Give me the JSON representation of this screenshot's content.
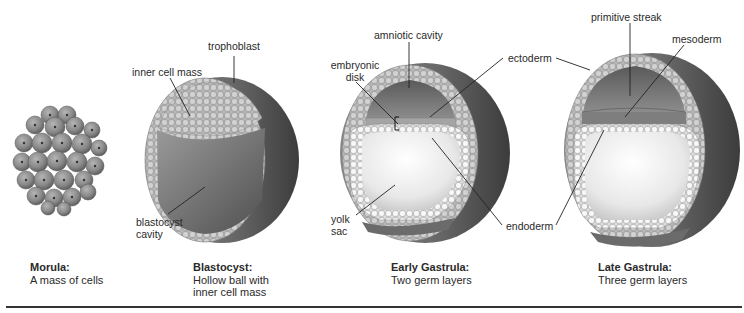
{
  "figure": {
    "stages": [
      {
        "id": "morula",
        "title": "Morula:",
        "description": [
          "A mass of cells"
        ]
      },
      {
        "id": "blastocyst",
        "title": "Blastocyst:",
        "description": [
          "Hollow ball with",
          "inner cell mass"
        ]
      },
      {
        "id": "early-gastrula",
        "title": "Early Gastrula:",
        "description": [
          "Two germ layers"
        ]
      },
      {
        "id": "late-gastrula",
        "title": "Late Gastrula:",
        "description": [
          "Three germ layers"
        ]
      }
    ],
    "labels": {
      "trophoblast": "trophoblast",
      "inner_cell_mass": "inner cell mass",
      "blastocyst_cavity_1": "blastocyst",
      "blastocyst_cavity_2": "cavity",
      "amniotic_cavity": "amniotic cavity",
      "embryonic_disk_1": "embryonic",
      "embryonic_disk_2": "disk",
      "ectoderm": "ectoderm",
      "yolk_sac_1": "yolk",
      "yolk_sac_2": "sac",
      "endoderm": "endoderm",
      "primitive_streak": "primitive streak",
      "mesoderm": "mesoderm"
    },
    "colors": {
      "cell_fill": "#9a9a9a",
      "cell_light": "#d8d8d8",
      "sphere_dark": "#4a4a4a",
      "sphere_mid": "#7a7a7a",
      "yolk_light": "#f2f2f2",
      "line": "#222222",
      "text": "#2a2a2a"
    }
  }
}
